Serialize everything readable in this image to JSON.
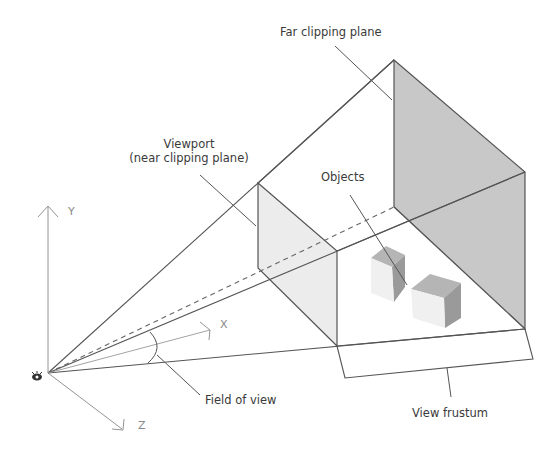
{
  "diagram": {
    "colors": {
      "line": "#4a4a4a",
      "far_plane_fill": "#c8c8c8",
      "near_plane_fill": "#ececec",
      "cube_top": "#b5b5b5",
      "cube_side": "#9a9a9a",
      "cube_front": "#f0f0f0",
      "text": "#3a3a3a",
      "axis_text": "#888888"
    },
    "labels": {
      "far_plane": "Far clipping plane",
      "viewport_line1": "Viewport",
      "viewport_line2": "(near clipping plane)",
      "objects": "Objects",
      "field_of_view": "Field of view",
      "view_frustum": "View frustum"
    },
    "axes": {
      "y": "Y",
      "x": "X",
      "z": "Z"
    },
    "icons": {
      "eye": "eye-icon"
    }
  }
}
